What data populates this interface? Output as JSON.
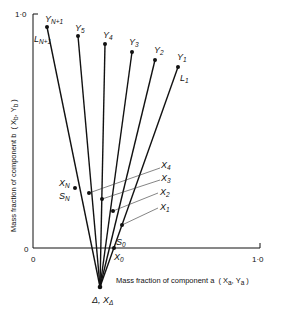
{
  "diagram": {
    "type": "ponchon-savarit-style operating lines diagram",
    "x_axis": {
      "title": "Mass fraction of component a",
      "title_vars": "( X",
      "title_sub1": "a",
      "title_sep": ", Y",
      "title_sub2": "a",
      "title_end": ")",
      "tick_start": "0",
      "tick_end": "1·0"
    },
    "y_axis": {
      "title": "Mass fraction of component b",
      "title_vars": "( X",
      "title_sub1": "b",
      "title_sep": ", Y",
      "title_sub2": "b",
      "title_end": ")",
      "tick_start": "0",
      "tick_end": "1·0"
    },
    "pole": {
      "label": "Δ, X",
      "sub": "Δ"
    },
    "top_points": [
      {
        "label": "Y",
        "sub": "N+1"
      },
      {
        "label": "Y",
        "sub": "5"
      },
      {
        "label": "Y",
        "sub": "4"
      },
      {
        "label": "Y",
        "sub": "3"
      },
      {
        "label": "Y",
        "sub": "2"
      },
      {
        "label": "Y",
        "sub": "1"
      }
    ],
    "line_labels": [
      {
        "label": "L",
        "sub": "N+1"
      },
      {
        "label": "L",
        "sub": "1"
      }
    ],
    "lower_points": [
      {
        "label": "X",
        "sub": "N"
      },
      {
        "label": "X",
        "sub": "4"
      },
      {
        "label": "X",
        "sub": "3"
      },
      {
        "label": "X",
        "sub": "2"
      },
      {
        "label": "X",
        "sub": "1"
      },
      {
        "label": "X",
        "sub": "0"
      }
    ],
    "s_labels": [
      {
        "label": "S",
        "sub": "N"
      },
      {
        "label": "S",
        "sub": "0"
      }
    ]
  }
}
